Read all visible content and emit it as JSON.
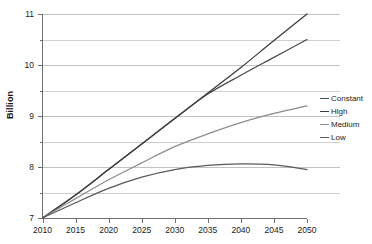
{
  "chart_data": {
    "type": "line",
    "title": "",
    "subtitle": "",
    "xlabel": "",
    "ylabel": "Billion",
    "xlim": [
      2010,
      2050
    ],
    "ylim": [
      7,
      11
    ],
    "grid": true,
    "legend_position": "right",
    "x_ticks": [
      "2010",
      "2015",
      "2020",
      "2025",
      "2030",
      "2035",
      "2040",
      "2045",
      "2050"
    ],
    "y_ticks": [
      "7",
      "8",
      "9",
      "10",
      "11"
    ],
    "y_minor_ticks": [
      "7.5",
      "8.5",
      "9.5",
      "10.5"
    ],
    "x": [
      2010,
      2015,
      2020,
      2025,
      2030,
      2035,
      2040,
      2045,
      2050
    ],
    "series": [
      {
        "name": "Constant",
        "color": "#4a4a4a",
        "values": [
          7.0,
          7.45,
          7.95,
          8.45,
          8.95,
          9.43,
          9.8,
          10.15,
          10.5
        ]
      },
      {
        "name": "High",
        "color": "#3b3b3b",
        "values": [
          7.0,
          7.45,
          7.95,
          8.45,
          8.95,
          9.45,
          9.95,
          10.48,
          11.0
        ]
      },
      {
        "name": "Medium",
        "color": "#8c8c8c",
        "values": [
          7.0,
          7.38,
          7.75,
          8.08,
          8.4,
          8.65,
          8.87,
          9.05,
          9.2
        ]
      },
      {
        "name": "Low",
        "color": "#5a5a5a",
        "values": [
          7.0,
          7.3,
          7.58,
          7.8,
          7.95,
          8.03,
          8.06,
          8.04,
          7.95
        ]
      }
    ]
  },
  "legend": {
    "items": [
      {
        "label": "Constant",
        "color": "#4a4a4a"
      },
      {
        "label": "High",
        "color": "#3b3b3b"
      },
      {
        "label": "Medium",
        "color": "#8c8c8c"
      },
      {
        "label": "Low",
        "color": "#5a5a5a"
      }
    ]
  },
  "axes": {
    "y_title": "Billion"
  }
}
